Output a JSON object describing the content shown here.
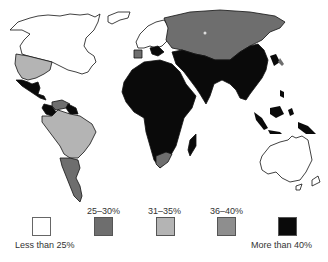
{
  "map": {
    "type": "choropleth world map",
    "colors": {
      "lt25": "#ffffff",
      "r25_30": "#6e6e6e",
      "r31_35": "#b4b4b4",
      "r36_40": "#8e8e8e",
      "gt40": "#0a0a0a",
      "outline": "#111111"
    },
    "regions": [
      {
        "name": "Canada",
        "category": "Less than 25%"
      },
      {
        "name": "USA",
        "category": "31–35%"
      },
      {
        "name": "Mexico & Central America",
        "category": "More than 40%"
      },
      {
        "name": "Brazil",
        "category": "31–35%"
      },
      {
        "name": "Southern South America",
        "category": "25–30%"
      },
      {
        "name": "Northwest South America",
        "category": "More than 40%"
      },
      {
        "name": "Venezuela",
        "category": "25–30%"
      },
      {
        "name": "Europe",
        "category": "Less than 25%"
      },
      {
        "name": "USSR",
        "category": "25–30%"
      },
      {
        "name": "Africa",
        "category": "More than 40%"
      },
      {
        "name": "South Africa",
        "category": "25–30%"
      },
      {
        "name": "Middle East",
        "category": "More than 40%"
      },
      {
        "name": "South & East Asia",
        "category": "More than 40%"
      },
      {
        "name": "Australia",
        "category": "Less than 25%"
      }
    ]
  },
  "legend": {
    "items": [
      {
        "label": "Less than 25%",
        "color": "#ffffff"
      },
      {
        "label": "25–30%",
        "color": "#6e6e6e"
      },
      {
        "label": "31–35%",
        "color": "#b4b4b4"
      },
      {
        "label": "36–40%",
        "color": "#8e8e8e"
      },
      {
        "label": "More than 40%",
        "color": "#0a0a0a"
      }
    ]
  }
}
